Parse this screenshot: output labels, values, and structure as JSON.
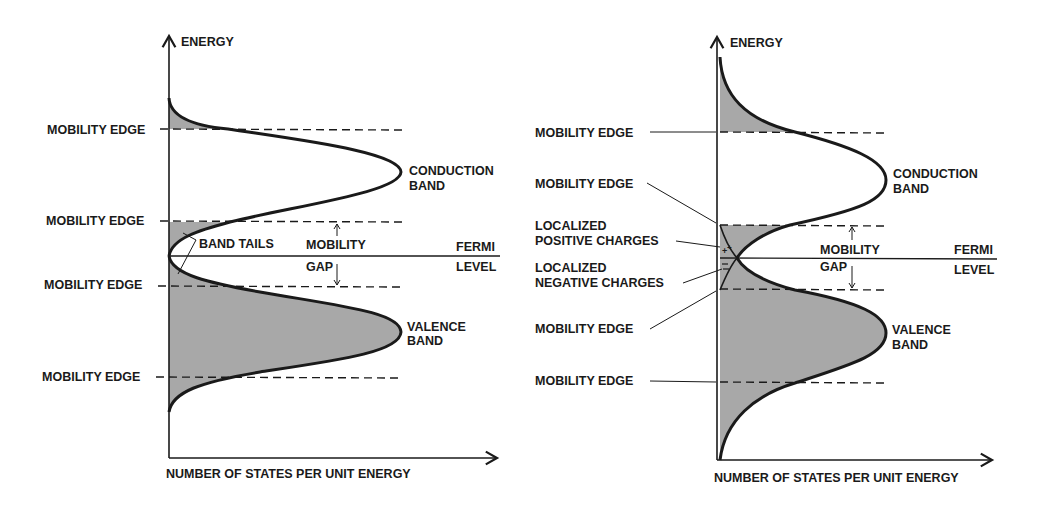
{
  "colors": {
    "ink": "#1a1a1a",
    "shade": "#a8a8a8",
    "paper": "#ffffff"
  },
  "left_diagram": {
    "y_axis_label": "ENERGY",
    "x_axis_label": "NUMBER OF STATES PER UNIT ENERGY",
    "mobility_edges": [
      "MOBILITY EDGE",
      "MOBILITY EDGE",
      "MOBILITY EDGE",
      "MOBILITY EDGE"
    ],
    "conduction_band": [
      "CONDUCTION",
      "BAND"
    ],
    "valence_band": [
      "VALENCE",
      "BAND"
    ],
    "band_tails": "BAND TAILS",
    "mobility_gap": [
      "MOBILITY",
      "GAP"
    ],
    "fermi_level": [
      "FERMI",
      "LEVEL"
    ]
  },
  "right_diagram": {
    "y_axis_label": "ENERGY",
    "x_axis_label": "NUMBER OF STATES PER UNIT ENERGY",
    "mobility_edges": [
      "MOBILITY EDGE",
      "MOBILITY EDGE",
      "MOBILITY EDGE",
      "MOBILITY EDGE"
    ],
    "localized_positive": [
      "LOCALIZED",
      "POSITIVE CHARGES"
    ],
    "localized_negative": [
      "LOCALIZED",
      "NEGATIVE CHARGES"
    ],
    "conduction_band": [
      "CONDUCTION",
      "BAND"
    ],
    "valence_band": [
      "VALENCE",
      "BAND"
    ],
    "mobility_gap": [
      "MOBILITY",
      "GAP"
    ],
    "fermi_level": [
      "FERMI",
      "LEVEL"
    ]
  }
}
